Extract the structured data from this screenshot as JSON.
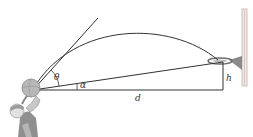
{
  "diagram": {
    "type": "physics-projectile",
    "labels": {
      "theta": "θ",
      "alpha": "α",
      "distance": "d",
      "height": "h"
    },
    "colors": {
      "line": "#333333",
      "player": "#9a9a9a",
      "backboard": "#d9c9c4",
      "rim": "#7a7a7a"
    }
  }
}
